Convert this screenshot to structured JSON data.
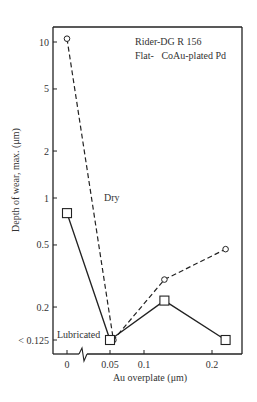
{
  "chart_data": {
    "type": "line",
    "title": "",
    "xlabel": "Au overplate (μm)",
    "ylabel": "Depth of wear, max. (μm)",
    "yscale": "log",
    "ylim": [
      0.1,
      12
    ],
    "x_ticks": [
      {
        "value": 0,
        "label": "0"
      },
      {
        "value": 0.05,
        "label": "0.05"
      },
      {
        "value": 0.1,
        "label": "0.1"
      },
      {
        "value": 0.2,
        "label": "0.2"
      }
    ],
    "y_ticks": [
      {
        "value": 10,
        "label": "10"
      },
      {
        "value": 5,
        "label": "5"
      },
      {
        "value": 2,
        "label": "2"
      },
      {
        "value": 1,
        "label": "1"
      },
      {
        "value": 0.5,
        "label": "0.5"
      },
      {
        "value": 0.2,
        "label": "0.2"
      },
      {
        "value": 0.125,
        "label": "< 0.125"
      }
    ],
    "x_axis_break": "between 0 and 0.05",
    "grid": false,
    "annotations": [
      {
        "text": "Rider-DG R 156",
        "position": "top-right"
      },
      {
        "text": "Flat-   CoAu-plated Pd",
        "position": "top-right"
      }
    ],
    "series": [
      {
        "name": "Dry",
        "style": "dashed",
        "marker": "circle",
        "x": [
          0,
          0.055,
          0.13,
          0.22
        ],
        "y": [
          10.5,
          0.125,
          0.3,
          0.47
        ]
      },
      {
        "name": "Lubricated",
        "style": "solid",
        "marker": "square",
        "x": [
          0,
          0.05,
          0.13,
          0.22
        ],
        "y": [
          0.8,
          0.125,
          0.22,
          0.125
        ]
      }
    ]
  }
}
